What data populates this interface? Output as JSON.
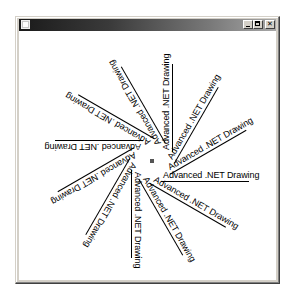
{
  "window": {
    "title": "",
    "buttons": {
      "minimize": "minimize",
      "maximize": "maximize",
      "close": "close"
    }
  },
  "drawing": {
    "center": {
      "x": 133,
      "y": 130
    },
    "label": "Advanced .NET Drawing",
    "angles_deg": [
      0,
      30,
      60,
      90,
      120,
      150,
      180,
      210,
      240,
      270,
      300,
      330
    ],
    "text_color": "#000000",
    "dot_color": "#555555"
  }
}
